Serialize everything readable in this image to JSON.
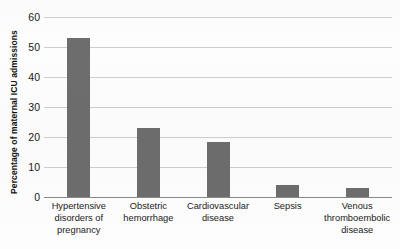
{
  "chart_data": {
    "type": "bar",
    "title": "",
    "xlabel": "",
    "ylabel": "Percentage of maternal ICU admissions",
    "ylim": [
      0,
      60
    ],
    "yticks": [
      60,
      50,
      40,
      30,
      20,
      10,
      0
    ],
    "grid": true,
    "legend": "none",
    "bar_color": "#6d6d6d",
    "categories": [
      "Hypertensive disorders of pregnancy",
      "Obstetric hemorrhage",
      "Cardiovascular disease",
      "Sepsis",
      "Venous thromboembolic disease"
    ],
    "category_lines": [
      [
        "Hypertensive",
        "disorders of",
        "pregnancy"
      ],
      [
        "Obstetric",
        "hemorrhage"
      ],
      [
        "Cardiovascular",
        "disease"
      ],
      [
        "Sepsis"
      ],
      [
        "Venous",
        "thromboembolic",
        "disease"
      ]
    ],
    "values": [
      53,
      23,
      18.5,
      4,
      3
    ]
  }
}
